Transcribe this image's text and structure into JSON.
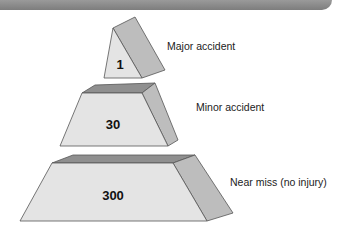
{
  "diagram": {
    "type": "accident-pyramid",
    "colors": {
      "front": "#e4e4e4",
      "side": "#bdbdbd",
      "top": "#8f8f8f",
      "edge": "#555555",
      "header_bar": "#888888"
    },
    "tiers": [
      {
        "value": "1",
        "label": "Major accident"
      },
      {
        "value": "30",
        "label": "Minor accident"
      },
      {
        "value": "300",
        "label": "Near miss (no injury)"
      }
    ]
  }
}
